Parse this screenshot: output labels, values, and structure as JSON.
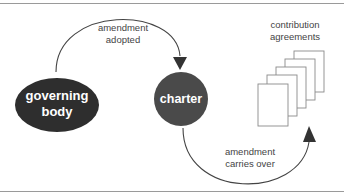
{
  "diagram": {
    "nodes": {
      "governing_body": {
        "line1": "governing",
        "line2": "body",
        "fill": "#2e2e2e"
      },
      "charter": {
        "label": "charter",
        "fill": "#4a4a4a"
      },
      "contribution_agreements": {
        "line1": "contribution",
        "line2": "agreements",
        "count": 5
      }
    },
    "edges": {
      "top": {
        "line1": "amendment",
        "line2": "adopted",
        "from": "governing body",
        "to": "charter"
      },
      "bottom": {
        "line1": "amendment",
        "line2": "carries over",
        "from": "charter",
        "to": "contribution agreements"
      }
    },
    "colors": {
      "line": "#444444",
      "arrow": "#333333",
      "rule": "#9a9a9a",
      "doc_border": "#8a8a8a"
    }
  }
}
